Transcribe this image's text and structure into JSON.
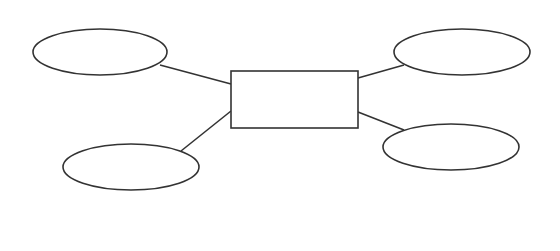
{
  "diagram": {
    "type": "er-diagram",
    "background": "#ffffff",
    "stroke_color": "#333333",
    "entity": {
      "shape": "rectangle",
      "label": "",
      "x": 231,
      "y": 71,
      "width": 127,
      "height": 57
    },
    "attributes": [
      {
        "id": "top-left",
        "shape": "ellipse",
        "label": "",
        "cx": 100,
        "cy": 52,
        "rx": 67,
        "ry": 23
      },
      {
        "id": "top-right",
        "shape": "ellipse",
        "label": "",
        "cx": 462,
        "cy": 52,
        "rx": 68,
        "ry": 23
      },
      {
        "id": "bottom-left",
        "shape": "ellipse",
        "label": "",
        "cx": 131,
        "cy": 167,
        "rx": 68,
        "ry": 23
      },
      {
        "id": "bottom-right",
        "shape": "ellipse",
        "label": "",
        "cx": 451,
        "cy": 147,
        "rx": 68,
        "ry": 23
      }
    ],
    "connectors": [
      {
        "from": "top-left",
        "to": "entity",
        "x1": 160,
        "y1": 65,
        "x2": 231,
        "y2": 84
      },
      {
        "from": "bottom-left",
        "to": "entity",
        "x1": 181,
        "y1": 151,
        "x2": 231,
        "y2": 111
      },
      {
        "from": "top-right",
        "to": "entity",
        "x1": 404,
        "y1": 65,
        "x2": 358,
        "y2": 78
      },
      {
        "from": "bottom-right",
        "to": "entity",
        "x1": 404,
        "y1": 130,
        "x2": 358,
        "y2": 112
      }
    ]
  }
}
